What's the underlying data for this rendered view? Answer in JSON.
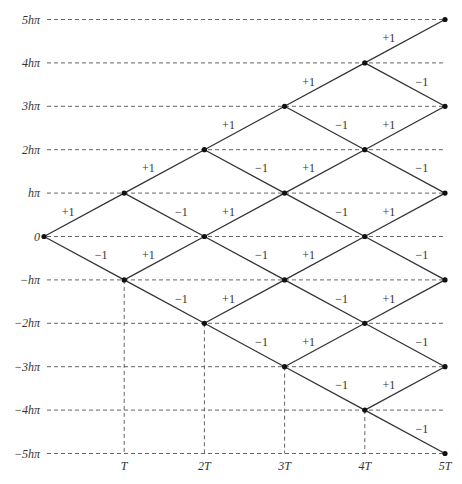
{
  "chart_data": {
    "type": "lattice",
    "title": "",
    "steps": 5,
    "x_ticks": [
      {
        "step": 1,
        "label": "T"
      },
      {
        "step": 2,
        "label": "2T"
      },
      {
        "step": 3,
        "label": "3T"
      },
      {
        "step": 4,
        "label": "4T"
      },
      {
        "step": 5,
        "label": "5T"
      }
    ],
    "y_ticks": [
      {
        "level": 5,
        "label": "5hπ"
      },
      {
        "level": 4,
        "label": "4hπ"
      },
      {
        "level": 3,
        "label": "3hπ"
      },
      {
        "level": 2,
        "label": "2hπ"
      },
      {
        "level": 1,
        "label": "hπ"
      },
      {
        "level": 0,
        "label": "0"
      },
      {
        "level": -1,
        "label": "−hπ"
      },
      {
        "level": -2,
        "label": "−2hπ"
      },
      {
        "level": -3,
        "label": "−3hπ"
      },
      {
        "level": -4,
        "label": "−4hπ"
      },
      {
        "level": -5,
        "label": "−5hπ"
      }
    ],
    "up_label": "+1",
    "down_label": "−1",
    "x_range": [
      0,
      5
    ],
    "y_range": [
      -5,
      5
    ],
    "grid": "dashed horizontal at every level; dashed vertical from lowest node of each step to bottom"
  }
}
